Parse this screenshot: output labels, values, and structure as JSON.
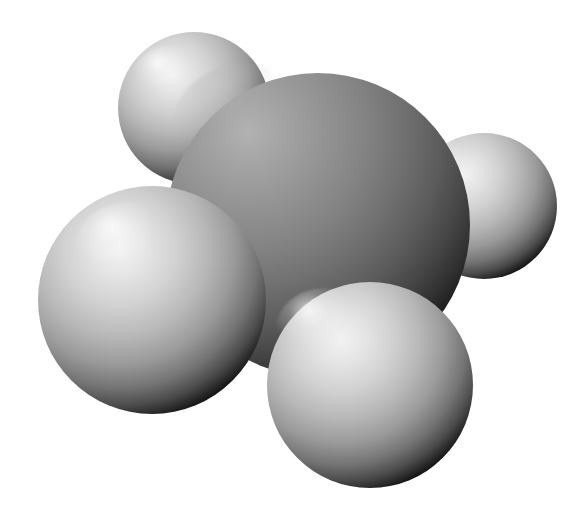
{
  "image": {
    "kind": "space-filling-molecular-model",
    "title": "Space-filling model of methane",
    "render_style": "CPK space-filling, grayscale, smooth Phong shading",
    "width": 583,
    "height": 514,
    "background_color": "#ffffff",
    "light_direction": "upper-left",
    "colors": {
      "background": "#ffffff",
      "carbon_highlight": "#a8a8a8",
      "carbon_midtone": "#7e7e7e",
      "carbon_shadow": "#3a3a3a",
      "carbon_rim": "#1c1c1c",
      "hydrogen_highlight": "#ececec",
      "hydrogen_midtone": "#bdbdbd",
      "hydrogen_shadow": "#5a5a5a",
      "hydrogen_rim": "#141414"
    }
  },
  "molecule": {
    "name": "Methane",
    "formula": "CH4",
    "geometry": "tetrahedral",
    "atom_count": 5,
    "atoms": [
      {
        "id": "H-top-left",
        "element": "H",
        "label": "hydrogen",
        "cx": 194,
        "cy": 108,
        "r": 76,
        "z_order": 1,
        "shade": "hydrogen",
        "highlight_x": "34%",
        "highlight_y": "30%"
      },
      {
        "id": "H-right",
        "element": "H",
        "label": "hydrogen",
        "cx": 484,
        "cy": 206,
        "r": 73,
        "z_order": 2,
        "shade": "hydrogen",
        "highlight_x": "24%",
        "highlight_y": "26%"
      },
      {
        "id": "C-center",
        "element": "C",
        "label": "carbon",
        "cx": 318,
        "cy": 225,
        "r": 152,
        "z_order": 3,
        "shade": "carbon",
        "highlight_x": "26%",
        "highlight_y": "18%"
      },
      {
        "id": "H-bottom-left",
        "element": "H",
        "label": "hydrogen",
        "cx": 152,
        "cy": 300,
        "r": 114,
        "z_order": 4,
        "shade": "hydrogen",
        "highlight_x": "40%",
        "highlight_y": "28%"
      },
      {
        "id": "H-bottom-center",
        "element": "H",
        "label": "hydrogen",
        "cx": 370,
        "cy": 385,
        "r": 103,
        "z_order": 5,
        "shade": "hydrogen",
        "highlight_x": "28%",
        "highlight_y": "24%"
      }
    ]
  }
}
